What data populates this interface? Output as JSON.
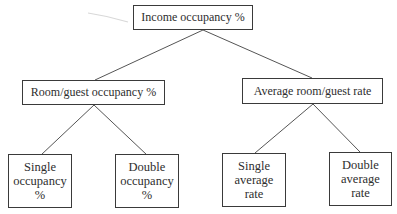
{
  "diagram": {
    "type": "tree",
    "root": {
      "label": "Income occupancy %"
    },
    "level2": [
      {
        "label": "Room/guest occupancy %",
        "children": [
          {
            "lines": [
              "Single",
              "occupancy",
              "%"
            ]
          },
          {
            "lines": [
              "Double",
              "occupancy",
              "%"
            ]
          }
        ]
      },
      {
        "label": "Average room/guest rate",
        "children": [
          {
            "lines": [
              "Single",
              "average",
              "rate"
            ]
          },
          {
            "lines": [
              "Double",
              "average",
              "rate"
            ]
          }
        ]
      }
    ],
    "colors": {
      "background": "#ffffff",
      "stroke": "#3a3a3a",
      "text": "#2e2e2e",
      "connector": "#555555"
    }
  }
}
